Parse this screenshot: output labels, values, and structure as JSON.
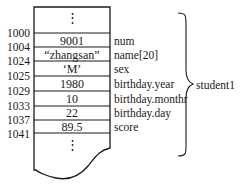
{
  "diagram": {
    "title": "",
    "top_ellipsis": "⋮",
    "bottom_ellipsis": "⋮",
    "rows": [
      {
        "address": "1000",
        "value": "9001",
        "field": "num"
      },
      {
        "address": "1004",
        "value": "“zhangsan”",
        "field": "name[20]"
      },
      {
        "address": "1024",
        "value": "‘M’",
        "field": "sex"
      },
      {
        "address": "1025",
        "value": "1980",
        "field": "birthday.year"
      },
      {
        "address": "1029",
        "value": "10",
        "field": "birthday.monthr"
      },
      {
        "address": "1033",
        "value": "22",
        "field": "birthday.day"
      },
      {
        "address": "1037",
        "value": "89.5",
        "field": "score"
      }
    ],
    "end_address": "1041",
    "group_label": "student1",
    "colors": {
      "line": "#1a1a1a",
      "background": "#ffffff"
    }
  }
}
